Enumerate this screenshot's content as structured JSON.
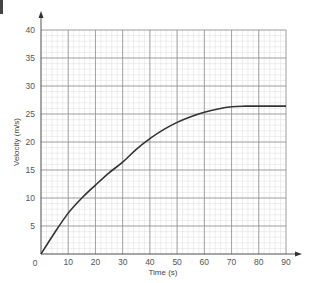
{
  "chart_data": {
    "type": "line",
    "title": "",
    "xlabel": "Time (s)",
    "ylabel": "Velocity (m/s)",
    "xlim": [
      0,
      90
    ],
    "ylim": [
      0,
      40
    ],
    "x_ticks": [
      0,
      10,
      20,
      30,
      40,
      50,
      60,
      70,
      80,
      90
    ],
    "y_ticks": [
      5,
      10,
      15,
      20,
      25,
      30,
      35,
      40
    ],
    "grid": true,
    "grid_style": "graph paper (major every 10 s / 5 m/s, minor every 2 s / 1 m/s)",
    "legend": "none",
    "series": [
      {
        "name": "velocity",
        "x": [
          0,
          5,
          10,
          15,
          20,
          25,
          30,
          35,
          40,
          45,
          50,
          55,
          60,
          65,
          70,
          75,
          80,
          85,
          90
        ],
        "values": [
          0,
          3.8,
          7.3,
          10.0,
          12.3,
          14.5,
          16.4,
          18.7,
          20.6,
          22.2,
          23.5,
          24.5,
          25.3,
          25.9,
          26.3,
          26.4,
          26.4,
          26.4,
          26.4
        ]
      }
    ],
    "annotations": []
  },
  "labels": {
    "origin": "0"
  },
  "colors": {
    "curve": "#333333",
    "major_grid": "#8f8f8f",
    "minor_grid": "#dcdcdc",
    "axis": "#555555"
  }
}
